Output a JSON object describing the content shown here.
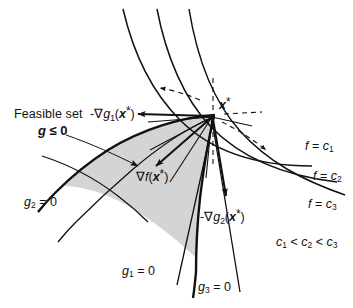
{
  "figure": {
    "background_color": "#ffffff",
    "line_color": "#111111",
    "shade_color": "#d4d4d4"
  },
  "labels": {
    "feasible_set": "Feasible set",
    "feasible_constraint_g": "g",
    "feasible_constraint_rel": " ≤ ",
    "feasible_constraint_val": "0",
    "grad_g1": {
      "sign": "-",
      "nabla": "∇",
      "fn": "g",
      "sub": "1",
      "arg_open": "(",
      "arg": "x",
      "star": "*",
      "arg_close": ")"
    },
    "grad_f": {
      "nabla": "∇",
      "fn": "f",
      "arg_open": "(",
      "arg": "x",
      "star": "*",
      "arg_close": ")"
    },
    "grad_g2": {
      "sign": "-",
      "nabla": "∇",
      "fn": "g",
      "sub": "2",
      "arg_open": "(",
      "arg": "x",
      "star": "*",
      "arg_close": ")"
    },
    "x_star": {
      "sym": "x",
      "star": "*"
    },
    "constraints": [
      {
        "name": "g1-zero-label",
        "fn": "g",
        "sub": "1",
        "eq": " = 0"
      },
      {
        "name": "g2-zero-label",
        "fn": "g",
        "sub": "2",
        "eq": " = 0"
      },
      {
        "name": "g3-zero-label",
        "fn": "g",
        "sub": "3",
        "eq": " = 0"
      }
    ],
    "contours": [
      {
        "name": "contour-label-c1",
        "fn": "f",
        "eq": " = ",
        "c": "c",
        "sub": "1"
      },
      {
        "name": "contour-label-c2",
        "fn": "f",
        "eq": " = ",
        "c": "c",
        "sub": "2"
      },
      {
        "name": "contour-label-c3",
        "fn": "f",
        "eq": " = ",
        "c": "c",
        "sub": "3"
      }
    ],
    "ordering": {
      "c": "c",
      "s1": "1",
      "lt1": " < ",
      "s2": "2",
      "lt2": " < ",
      "s3": "3"
    }
  }
}
